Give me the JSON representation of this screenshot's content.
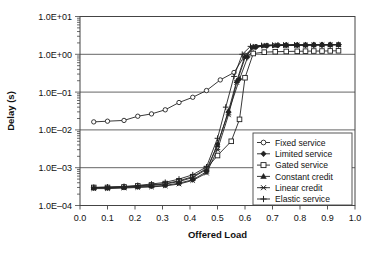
{
  "chart_data": {
    "type": "line",
    "title": "",
    "xlabel": "Offered Load",
    "ylabel": "Delay (s)",
    "yscale": "log",
    "xlim": [
      0.0,
      1.0
    ],
    "ylim": [
      0.0001,
      10
    ],
    "grid": true,
    "legend_position": "lower-right-inside",
    "xticks": [
      "0.0",
      "0.1",
      "0.2",
      "0.3",
      "0.4",
      "0.5",
      "0.6",
      "0.7",
      "0.8",
      "0.9",
      "1.0"
    ],
    "xtick_values": [
      0.0,
      0.1,
      0.2,
      0.3,
      0.4,
      0.5,
      0.6,
      0.7,
      0.8,
      0.9,
      1.0
    ],
    "yticks": [
      "1.0E-04",
      "1.0E-03",
      "1.0E-02",
      "1.0E-01",
      "1.0E+00",
      "1.0E+01"
    ],
    "ytick_values": [
      0.0001,
      0.001,
      0.01,
      0.1,
      1,
      10
    ],
    "series": [
      {
        "name": "Fixed service",
        "marker": "circle-open",
        "x": [
          0.05,
          0.1,
          0.16,
          0.21,
          0.26,
          0.31,
          0.36,
          0.41,
          0.46,
          0.51,
          0.56,
          0.6,
          0.64,
          0.68,
          0.72,
          0.75,
          0.79,
          0.82,
          0.85,
          0.88,
          0.91,
          0.94
        ],
        "y": [
          0.0163,
          0.017,
          0.0178,
          0.023,
          0.0265,
          0.034,
          0.053,
          0.073,
          0.11,
          0.21,
          0.33,
          0.95,
          1.6,
          1.72,
          1.75,
          1.76,
          1.76,
          1.77,
          1.78,
          1.78,
          1.79,
          1.8
        ]
      },
      {
        "name": "Limited service",
        "marker": "diamond-filled",
        "x": [
          0.05,
          0.1,
          0.16,
          0.21,
          0.26,
          0.31,
          0.36,
          0.41,
          0.46,
          0.5,
          0.54,
          0.58,
          0.61,
          0.64,
          0.68,
          0.72,
          0.75,
          0.79,
          0.82,
          0.85,
          0.88,
          0.91,
          0.94
        ],
        "y": [
          0.00029,
          0.00029,
          0.0003,
          0.00031,
          0.00032,
          0.00034,
          0.00039,
          0.00048,
          0.00078,
          0.0042,
          0.03,
          0.22,
          0.85,
          1.55,
          1.68,
          1.72,
          1.74,
          1.75,
          1.76,
          1.77,
          1.78,
          1.79,
          1.8
        ]
      },
      {
        "name": "Gated service",
        "marker": "square-open",
        "x": [
          0.05,
          0.1,
          0.16,
          0.21,
          0.26,
          0.31,
          0.36,
          0.41,
          0.46,
          0.5,
          0.55,
          0.58,
          0.6,
          0.63,
          0.67,
          0.71,
          0.75,
          0.79,
          0.82,
          0.85,
          0.88,
          0.91,
          0.94
        ],
        "y": [
          0.0003,
          0.0003,
          0.00031,
          0.00033,
          0.00035,
          0.00038,
          0.00045,
          0.00058,
          0.00095,
          0.0021,
          0.005,
          0.019,
          0.24,
          1.05,
          1.14,
          1.17,
          1.19,
          1.2,
          1.21,
          1.22,
          1.22,
          1.23,
          1.24
        ]
      },
      {
        "name": "Constant credit",
        "marker": "triangle-filled",
        "x": [
          0.05,
          0.1,
          0.16,
          0.21,
          0.26,
          0.31,
          0.36,
          0.41,
          0.46,
          0.5,
          0.54,
          0.57,
          0.6,
          0.63,
          0.67,
          0.71,
          0.75,
          0.79,
          0.82,
          0.85,
          0.88,
          0.91,
          0.94
        ],
        "y": [
          0.0003,
          0.0003,
          0.00031,
          0.00032,
          0.00034,
          0.00037,
          0.00043,
          0.00055,
          0.0009,
          0.004,
          0.032,
          0.2,
          0.9,
          1.6,
          1.7,
          1.73,
          1.75,
          1.76,
          1.77,
          1.78,
          1.79,
          1.79,
          1.8
        ]
      },
      {
        "name": "Linear credit",
        "marker": "cross-x",
        "x": [
          0.05,
          0.1,
          0.16,
          0.21,
          0.26,
          0.31,
          0.36,
          0.41,
          0.46,
          0.5,
          0.54,
          0.57,
          0.6,
          0.63,
          0.67,
          0.71,
          0.75,
          0.79,
          0.82,
          0.85,
          0.88,
          0.91,
          0.94
        ],
        "y": [
          0.00028,
          0.00028,
          0.00029,
          0.0003,
          0.00031,
          0.00033,
          0.00037,
          0.00046,
          0.00072,
          0.003,
          0.025,
          0.18,
          0.8,
          1.52,
          1.66,
          1.71,
          1.73,
          1.75,
          1.76,
          1.77,
          1.78,
          1.78,
          1.79
        ]
      },
      {
        "name": "Elastic service",
        "marker": "plus",
        "x": [
          0.05,
          0.1,
          0.16,
          0.21,
          0.26,
          0.31,
          0.36,
          0.41,
          0.46,
          0.5,
          0.53,
          0.56,
          0.59,
          0.62,
          0.66,
          0.7,
          0.74,
          0.78,
          0.82,
          0.85,
          0.88,
          0.91,
          0.94
        ],
        "y": [
          0.0003,
          0.00031,
          0.00032,
          0.00034,
          0.00037,
          0.00041,
          0.0005,
          0.00065,
          0.00105,
          0.006,
          0.04,
          0.26,
          1.0,
          1.62,
          1.71,
          1.74,
          1.76,
          1.77,
          1.78,
          1.79,
          1.79,
          1.8,
          1.81
        ]
      }
    ],
    "colors": {
      "line": "#222222",
      "grid": "#555555",
      "frame": "#444444",
      "background": "#ffffff"
    }
  }
}
